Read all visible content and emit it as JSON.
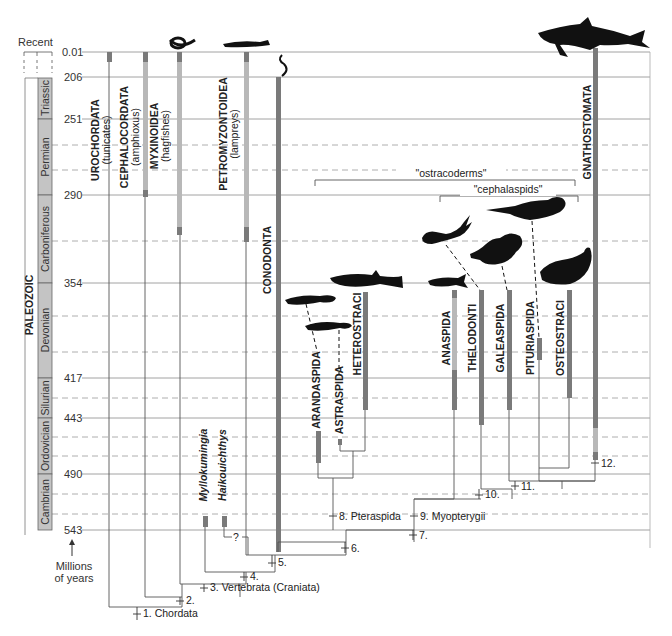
{
  "time_axis": {
    "recent_label": "Recent",
    "unit_label_line1": "Millions",
    "unit_label_line2": "of years",
    "era_label": "PALEOZOIC",
    "ticks": [
      "0.01",
      "206",
      "251",
      "290",
      "354",
      "417",
      "443",
      "490",
      "543"
    ],
    "periods": [
      "Triassic",
      "Permian",
      "Carboniferous",
      "Devonian",
      "Silurian",
      "Ordovician",
      "Cambrian"
    ]
  },
  "taxa": {
    "urochordata": {
      "name": "UROCHORDATA",
      "common": "(tunicates)"
    },
    "cephalochordata": {
      "name": "CEPHALOCORDATA",
      "common": "(amphioxus)"
    },
    "myxinoidea": {
      "name": "MYXINOIDEA",
      "common": "(hagfishes)"
    },
    "petromyzontoidea": {
      "name": "PETROMYZONTOIDEA",
      "common": "(lampreys)"
    },
    "conodonta": {
      "name": "CONODONTA"
    },
    "myllokunmingia": {
      "name": "Myllokumingia"
    },
    "haikouichthys": {
      "name": "Haikouichthys"
    },
    "arandaspida": {
      "name": "ARANDASPIDA"
    },
    "astraspida": {
      "name": "ASTRASPIDA"
    },
    "heterostraci": {
      "name": "HETEROSTRACI"
    },
    "anaspida": {
      "name": "ANASPIDA"
    },
    "thelodonti": {
      "name": "THELODONTI"
    },
    "galeaspida": {
      "name": "GALEASPIDA"
    },
    "pituriaspida": {
      "name": "PITURIASPIDA"
    },
    "osteostraci": {
      "name": "OSTEOSTRACI"
    },
    "gnathostomata": {
      "name": "GNATHOSTOMATA"
    }
  },
  "groups": {
    "ostracoderms": "\"ostracoderms\"",
    "cephalaspids": "\"cephalaspids\""
  },
  "nodes": {
    "n1": "1. Chordata",
    "n2": "2.",
    "n3": "3. Vertebrata (Craniata)",
    "n4": "4.",
    "n5": "5.",
    "n6": "6.",
    "n7": "7.",
    "n8": "8. Pteraspida",
    "n9": "9. Myopterygii",
    "n10": "10.",
    "n11": "11.",
    "n12": "12.",
    "question": "?"
  },
  "colors": {
    "dark_bar": "#7a7a7a",
    "light_bar": "#b8b8b8",
    "period_fill": "#c4c4c4",
    "grid": "#8a8a8a",
    "silhouette": "#111111"
  }
}
